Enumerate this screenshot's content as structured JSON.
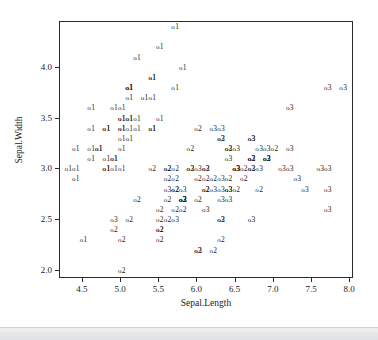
{
  "figure": {
    "background_color": "#ffffff",
    "frame_color": "#2b2b2b",
    "text_color": "#1a1a1a"
  },
  "chart_data": {
    "type": "scatter",
    "title": "",
    "xlabel": "Sepal.Length",
    "ylabel": "Sepal.Width",
    "xlim": [
      4.2,
      8.05
    ],
    "ylim": [
      1.92,
      4.45
    ],
    "xticks": [
      "4.5",
      "5.0",
      "5.5",
      "6.0",
      "6.5",
      "7.0",
      "7.5",
      "8.0"
    ],
    "xtick_values": [
      4.5,
      5.0,
      5.5,
      6.0,
      6.5,
      7.0,
      7.5,
      8.0
    ],
    "yticks": [
      "2.0",
      "2.5",
      "3.0",
      "3.5",
      "4.0"
    ],
    "ytick_values": [
      2.0,
      2.5,
      3.0,
      3.5,
      4.0
    ],
    "grid": false,
    "legend": "none",
    "marker": "o",
    "point_label_meaning": "species class code shown as digit next to each circle marker",
    "series": [
      {
        "name": "1",
        "label": "1"
      },
      {
        "name": "2",
        "label": "2"
      },
      {
        "name": "3",
        "label": "3"
      }
    ],
    "points": [
      {
        "x": 5.1,
        "y": 3.5,
        "label": "1"
      },
      {
        "x": 4.9,
        "y": 3.0,
        "label": "1"
      },
      {
        "x": 4.7,
        "y": 3.2,
        "label": "1"
      },
      {
        "x": 4.6,
        "y": 3.1,
        "label": "1"
      },
      {
        "x": 5.0,
        "y": 3.6,
        "label": "1"
      },
      {
        "x": 5.4,
        "y": 3.9,
        "label": "1"
      },
      {
        "x": 4.6,
        "y": 3.4,
        "label": "1"
      },
      {
        "x": 5.0,
        "y": 3.4,
        "label": "1"
      },
      {
        "x": 4.4,
        "y": 2.9,
        "label": "1"
      },
      {
        "x": 4.9,
        "y": 3.1,
        "label": "1"
      },
      {
        "x": 5.4,
        "y": 3.7,
        "label": "1"
      },
      {
        "x": 4.8,
        "y": 3.4,
        "label": "1"
      },
      {
        "x": 4.8,
        "y": 3.0,
        "label": "1"
      },
      {
        "x": 4.3,
        "y": 3.0,
        "label": "1"
      },
      {
        "x": 5.8,
        "y": 4.0,
        "label": "1"
      },
      {
        "x": 5.7,
        "y": 4.4,
        "label": "1"
      },
      {
        "x": 5.4,
        "y": 3.9,
        "label": "1"
      },
      {
        "x": 5.1,
        "y": 3.5,
        "label": "1"
      },
      {
        "x": 5.7,
        "y": 3.8,
        "label": "1"
      },
      {
        "x": 5.1,
        "y": 3.8,
        "label": "1"
      },
      {
        "x": 5.4,
        "y": 3.4,
        "label": "1"
      },
      {
        "x": 5.1,
        "y": 3.7,
        "label": "1"
      },
      {
        "x": 4.6,
        "y": 3.6,
        "label": "1"
      },
      {
        "x": 5.1,
        "y": 3.3,
        "label": "1"
      },
      {
        "x": 4.8,
        "y": 3.4,
        "label": "1"
      },
      {
        "x": 5.0,
        "y": 3.0,
        "label": "1"
      },
      {
        "x": 5.0,
        "y": 3.4,
        "label": "1"
      },
      {
        "x": 5.2,
        "y": 3.5,
        "label": "1"
      },
      {
        "x": 5.2,
        "y": 3.4,
        "label": "1"
      },
      {
        "x": 4.7,
        "y": 3.2,
        "label": "1"
      },
      {
        "x": 4.8,
        "y": 3.1,
        "label": "1"
      },
      {
        "x": 5.4,
        "y": 3.4,
        "label": "1"
      },
      {
        "x": 5.2,
        "y": 4.1,
        "label": "1"
      },
      {
        "x": 5.5,
        "y": 4.2,
        "label": "1"
      },
      {
        "x": 4.9,
        "y": 3.1,
        "label": "1"
      },
      {
        "x": 5.0,
        "y": 3.2,
        "label": "1"
      },
      {
        "x": 5.5,
        "y": 3.5,
        "label": "1"
      },
      {
        "x": 4.9,
        "y": 3.6,
        "label": "1"
      },
      {
        "x": 4.4,
        "y": 3.0,
        "label": "1"
      },
      {
        "x": 5.1,
        "y": 3.4,
        "label": "1"
      },
      {
        "x": 5.0,
        "y": 3.5,
        "label": "1"
      },
      {
        "x": 4.5,
        "y": 2.3,
        "label": "1"
      },
      {
        "x": 4.4,
        "y": 3.2,
        "label": "1"
      },
      {
        "x": 5.0,
        "y": 3.5,
        "label": "1"
      },
      {
        "x": 5.1,
        "y": 3.8,
        "label": "1"
      },
      {
        "x": 4.8,
        "y": 3.0,
        "label": "1"
      },
      {
        "x": 5.1,
        "y": 3.8,
        "label": "1"
      },
      {
        "x": 4.6,
        "y": 3.2,
        "label": "1"
      },
      {
        "x": 5.3,
        "y": 3.7,
        "label": "1"
      },
      {
        "x": 5.0,
        "y": 3.3,
        "label": "1"
      },
      {
        "x": 7.0,
        "y": 3.2,
        "label": "2"
      },
      {
        "x": 6.4,
        "y": 3.2,
        "label": "2"
      },
      {
        "x": 6.9,
        "y": 3.1,
        "label": "2"
      },
      {
        "x": 5.5,
        "y": 2.3,
        "label": "2"
      },
      {
        "x": 6.5,
        "y": 2.8,
        "label": "2"
      },
      {
        "x": 5.7,
        "y": 2.8,
        "label": "2"
      },
      {
        "x": 6.3,
        "y": 3.3,
        "label": "2"
      },
      {
        "x": 4.9,
        "y": 2.4,
        "label": "2"
      },
      {
        "x": 6.6,
        "y": 2.9,
        "label": "2"
      },
      {
        "x": 5.2,
        "y": 2.7,
        "label": "2"
      },
      {
        "x": 5.0,
        "y": 2.0,
        "label": "2"
      },
      {
        "x": 5.9,
        "y": 3.0,
        "label": "2"
      },
      {
        "x": 6.0,
        "y": 2.2,
        "label": "2"
      },
      {
        "x": 6.1,
        "y": 2.9,
        "label": "2"
      },
      {
        "x": 5.6,
        "y": 2.9,
        "label": "2"
      },
      {
        "x": 6.7,
        "y": 3.1,
        "label": "2"
      },
      {
        "x": 5.6,
        "y": 3.0,
        "label": "2"
      },
      {
        "x": 5.8,
        "y": 2.7,
        "label": "2"
      },
      {
        "x": 6.2,
        "y": 2.2,
        "label": "2"
      },
      {
        "x": 5.6,
        "y": 2.5,
        "label": "2"
      },
      {
        "x": 5.9,
        "y": 3.2,
        "label": "2"
      },
      {
        "x": 6.1,
        "y": 2.8,
        "label": "2"
      },
      {
        "x": 6.3,
        "y": 2.5,
        "label": "2"
      },
      {
        "x": 6.1,
        "y": 2.8,
        "label": "2"
      },
      {
        "x": 6.4,
        "y": 2.9,
        "label": "2"
      },
      {
        "x": 6.6,
        "y": 3.0,
        "label": "2"
      },
      {
        "x": 6.8,
        "y": 2.8,
        "label": "2"
      },
      {
        "x": 6.7,
        "y": 3.0,
        "label": "2"
      },
      {
        "x": 6.0,
        "y": 2.9,
        "label": "2"
      },
      {
        "x": 5.7,
        "y": 2.6,
        "label": "2"
      },
      {
        "x": 5.5,
        "y": 2.4,
        "label": "2"
      },
      {
        "x": 5.5,
        "y": 2.4,
        "label": "2"
      },
      {
        "x": 5.8,
        "y": 2.7,
        "label": "2"
      },
      {
        "x": 6.0,
        "y": 2.7,
        "label": "2"
      },
      {
        "x": 5.4,
        "y": 3.0,
        "label": "2"
      },
      {
        "x": 6.0,
        "y": 3.4,
        "label": "2"
      },
      {
        "x": 6.7,
        "y": 3.1,
        "label": "2"
      },
      {
        "x": 6.3,
        "y": 2.3,
        "label": "2"
      },
      {
        "x": 5.6,
        "y": 3.0,
        "label": "2"
      },
      {
        "x": 5.5,
        "y": 2.5,
        "label": "2"
      },
      {
        "x": 5.5,
        "y": 2.6,
        "label": "2"
      },
      {
        "x": 6.1,
        "y": 3.0,
        "label": "2"
      },
      {
        "x": 5.8,
        "y": 2.6,
        "label": "2"
      },
      {
        "x": 5.0,
        "y": 2.3,
        "label": "2"
      },
      {
        "x": 5.6,
        "y": 2.7,
        "label": "2"
      },
      {
        "x": 5.7,
        "y": 3.0,
        "label": "2"
      },
      {
        "x": 5.7,
        "y": 2.9,
        "label": "2"
      },
      {
        "x": 6.2,
        "y": 2.9,
        "label": "2"
      },
      {
        "x": 5.1,
        "y": 2.5,
        "label": "2"
      },
      {
        "x": 5.7,
        "y": 2.8,
        "label": "2"
      },
      {
        "x": 6.3,
        "y": 3.3,
        "label": "3"
      },
      {
        "x": 5.8,
        "y": 2.7,
        "label": "3"
      },
      {
        "x": 7.1,
        "y": 3.0,
        "label": "3"
      },
      {
        "x": 6.3,
        "y": 2.9,
        "label": "3"
      },
      {
        "x": 6.5,
        "y": 3.0,
        "label": "3"
      },
      {
        "x": 7.6,
        "y": 3.0,
        "label": "3"
      },
      {
        "x": 4.9,
        "y": 2.5,
        "label": "3"
      },
      {
        "x": 7.3,
        "y": 2.9,
        "label": "3"
      },
      {
        "x": 6.7,
        "y": 2.5,
        "label": "3"
      },
      {
        "x": 7.2,
        "y": 3.6,
        "label": "3"
      },
      {
        "x": 6.5,
        "y": 3.2,
        "label": "3"
      },
      {
        "x": 6.4,
        "y": 2.7,
        "label": "3"
      },
      {
        "x": 6.8,
        "y": 3.0,
        "label": "3"
      },
      {
        "x": 5.7,
        "y": 2.5,
        "label": "3"
      },
      {
        "x": 5.8,
        "y": 2.8,
        "label": "3"
      },
      {
        "x": 6.4,
        "y": 3.2,
        "label": "3"
      },
      {
        "x": 6.5,
        "y": 3.0,
        "label": "3"
      },
      {
        "x": 7.7,
        "y": 3.8,
        "label": "3"
      },
      {
        "x": 7.7,
        "y": 2.6,
        "label": "3"
      },
      {
        "x": 6.0,
        "y": 2.2,
        "label": "3"
      },
      {
        "x": 6.9,
        "y": 3.2,
        "label": "3"
      },
      {
        "x": 5.6,
        "y": 2.8,
        "label": "3"
      },
      {
        "x": 7.7,
        "y": 2.8,
        "label": "3"
      },
      {
        "x": 6.3,
        "y": 2.7,
        "label": "3"
      },
      {
        "x": 6.7,
        "y": 3.3,
        "label": "3"
      },
      {
        "x": 7.2,
        "y": 3.2,
        "label": "3"
      },
      {
        "x": 6.2,
        "y": 2.8,
        "label": "3"
      },
      {
        "x": 6.1,
        "y": 3.0,
        "label": "3"
      },
      {
        "x": 6.4,
        "y": 2.8,
        "label": "3"
      },
      {
        "x": 7.2,
        "y": 3.0,
        "label": "3"
      },
      {
        "x": 7.4,
        "y": 2.8,
        "label": "3"
      },
      {
        "x": 7.9,
        "y": 3.8,
        "label": "3"
      },
      {
        "x": 6.4,
        "y": 2.8,
        "label": "3"
      },
      {
        "x": 6.3,
        "y": 2.8,
        "label": "3"
      },
      {
        "x": 6.1,
        "y": 2.6,
        "label": "3"
      },
      {
        "x": 7.7,
        "y": 3.0,
        "label": "3"
      },
      {
        "x": 6.3,
        "y": 3.4,
        "label": "3"
      },
      {
        "x": 6.4,
        "y": 3.1,
        "label": "3"
      },
      {
        "x": 6.0,
        "y": 3.0,
        "label": "3"
      },
      {
        "x": 6.9,
        "y": 3.1,
        "label": "3"
      },
      {
        "x": 6.7,
        "y": 3.1,
        "label": "3"
      },
      {
        "x": 6.9,
        "y": 3.1,
        "label": "3"
      },
      {
        "x": 5.8,
        "y": 2.7,
        "label": "3"
      },
      {
        "x": 6.8,
        "y": 3.2,
        "label": "3"
      },
      {
        "x": 6.7,
        "y": 3.3,
        "label": "3"
      },
      {
        "x": 6.7,
        "y": 3.0,
        "label": "3"
      },
      {
        "x": 6.3,
        "y": 2.5,
        "label": "3"
      },
      {
        "x": 6.5,
        "y": 3.0,
        "label": "3"
      },
      {
        "x": 6.2,
        "y": 3.4,
        "label": "3"
      },
      {
        "x": 5.9,
        "y": 3.0,
        "label": "3"
      }
    ]
  }
}
